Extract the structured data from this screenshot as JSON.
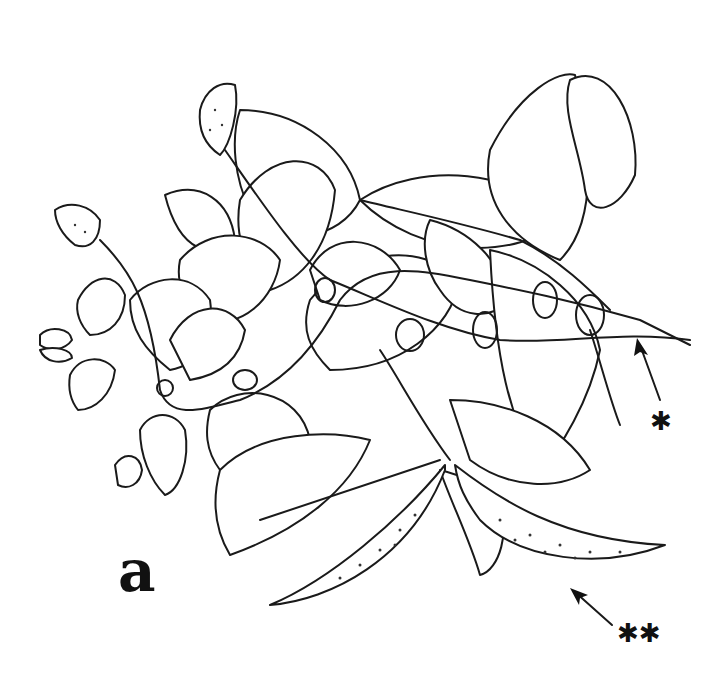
{
  "figure": {
    "panel_label": "a",
    "annotations": [
      {
        "id": "single-asterisk",
        "text": "✱",
        "points_to": "stem tip"
      },
      {
        "id": "double-asterisk",
        "text": "✱✱",
        "points_to": "elongated spotted fruits"
      }
    ]
  }
}
